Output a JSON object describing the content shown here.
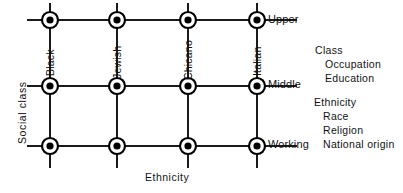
{
  "figure": {
    "axes": {
      "y_title": "Social  class",
      "x_title": "Ethnicity"
    },
    "columns": [
      {
        "label": "Black",
        "x": 50
      },
      {
        "label": "Jewish",
        "x": 117
      },
      {
        "label": "Chicano",
        "x": 188
      },
      {
        "label": "Italian",
        "x": 257
      }
    ],
    "rows": [
      {
        "label": "Upper",
        "y": 20
      },
      {
        "label": "Middle",
        "y": 86
      },
      {
        "label": "Working",
        "y": 146
      }
    ],
    "node": {
      "outer_radius": 8,
      "inner_radius": 3.6,
      "fill": "#000000",
      "ring_stroke": "#000000",
      "ring_stroke_width": 2.2,
      "inner_fill": "#ffffff"
    },
    "line_color": "#1a1a1a",
    "line_width": 1.1,
    "grid_bounds": {
      "h_line_x_start": 27,
      "h_line_x_end": 297,
      "v_line_y_start": 3,
      "v_line_y_end": 168
    }
  },
  "legend": {
    "groups": [
      {
        "heading": "Class",
        "items": [
          "Occupation",
          "Education"
        ]
      },
      {
        "heading": "Ethnicity",
        "items": [
          "Race",
          "Religion",
          "National  origin"
        ]
      }
    ]
  }
}
